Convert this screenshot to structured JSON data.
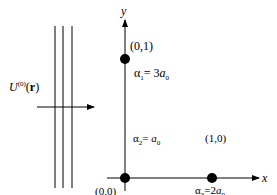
{
  "diagram": {
    "axes": {
      "x_label": "x",
      "y_label": "y"
    },
    "field": {
      "symbol": "U",
      "superscript": "(0)",
      "argument_open": "(",
      "argument": "r",
      "argument_close": ")"
    },
    "points": [
      {
        "coord": "(0,1)",
        "alpha_sym": "α",
        "alpha_sub": "1",
        "eq": "= 3",
        "a_sym": "a",
        "a_sub": "0"
      },
      {
        "coord": "(0,0)",
        "alpha_sym": "α",
        "alpha_sub": "2",
        "eq": "= ",
        "a_sym": "a",
        "a_sub": "0"
      },
      {
        "coord": "(1,0)",
        "alpha_sym": "α",
        "alpha_sub": "3",
        "eq": "=2",
        "a_sym": "a",
        "a_sub": "0"
      }
    ],
    "colors": {
      "stroke": "#000000",
      "background": "#ffffff"
    }
  }
}
